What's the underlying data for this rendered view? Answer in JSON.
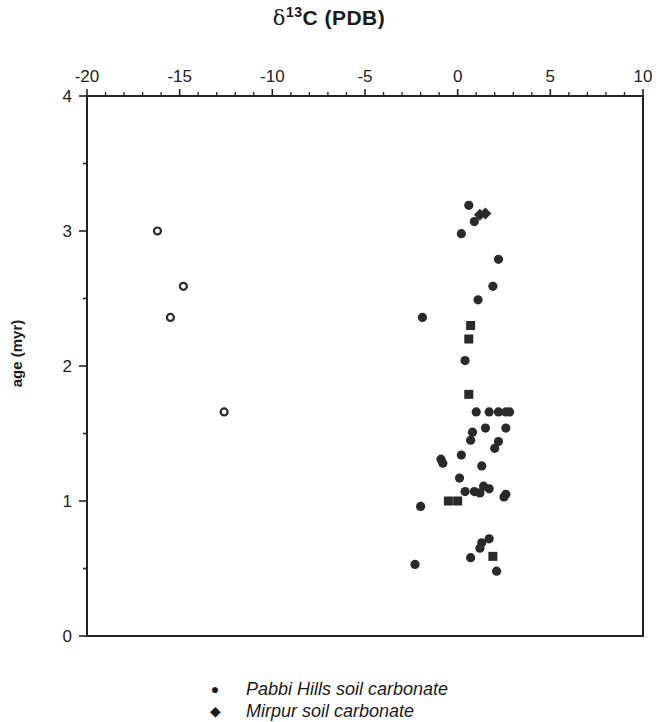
{
  "chart_data": {
    "type": "scatter",
    "title": "δ13C (PDB)",
    "title_parts": {
      "delta": "δ",
      "superscript": "13",
      "main": "C  (PDB)"
    },
    "xlabel": "δ13C (PDB)",
    "ylabel": "age (myr)",
    "x_axis_position": "top",
    "xlim": [
      -20,
      10
    ],
    "ylim": [
      0,
      4
    ],
    "x_ticks": [
      -20,
      -15,
      -10,
      -5,
      0,
      5,
      10
    ],
    "x_tick_labels": [
      "-20",
      "-15",
      "-10",
      "-5",
      "0",
      "5",
      "10"
    ],
    "x_minor_tick_step": 1,
    "y_ticks": [
      0,
      1,
      2,
      3,
      4
    ],
    "y_tick_labels": [
      "0",
      "1",
      "2",
      "3",
      "4"
    ],
    "y_minor_tick_step": 0.5,
    "grid": false,
    "legend_position": "bottom",
    "series": [
      {
        "name": "Pabbi Hills soil carbonate",
        "marker": "filled-circle",
        "points": [
          [
            0.6,
            3.19
          ],
          [
            0.9,
            3.07
          ],
          [
            0.2,
            2.98
          ],
          [
            2.2,
            2.79
          ],
          [
            1.9,
            2.59
          ],
          [
            1.1,
            2.49
          ],
          [
            -1.9,
            2.36
          ],
          [
            0.4,
            2.04
          ],
          [
            1.0,
            1.66
          ],
          [
            1.7,
            1.66
          ],
          [
            2.2,
            1.66
          ],
          [
            2.6,
            1.66
          ],
          [
            2.8,
            1.66
          ],
          [
            1.5,
            1.54
          ],
          [
            0.8,
            1.51
          ],
          [
            0.7,
            1.45
          ],
          [
            2.6,
            1.54
          ],
          [
            2.2,
            1.44
          ],
          [
            2.0,
            1.39
          ],
          [
            -0.9,
            1.31
          ],
          [
            -0.8,
            1.28
          ],
          [
            0.2,
            1.34
          ],
          [
            1.3,
            1.26
          ],
          [
            0.1,
            1.17
          ],
          [
            1.4,
            1.11
          ],
          [
            1.7,
            1.09
          ],
          [
            0.9,
            1.07
          ],
          [
            1.2,
            1.06
          ],
          [
            0.4,
            1.07
          ],
          [
            2.6,
            1.05
          ],
          [
            2.5,
            1.03
          ],
          [
            -2.0,
            0.96
          ],
          [
            1.7,
            0.72
          ],
          [
            1.3,
            0.69
          ],
          [
            1.2,
            0.65
          ],
          [
            0.7,
            0.58
          ],
          [
            2.1,
            0.48
          ],
          [
            -2.3,
            0.53
          ]
        ]
      },
      {
        "name": "Mirpur soil carbonate",
        "marker": "filled-diamond",
        "points": [
          [
            1.5,
            3.13
          ],
          [
            1.2,
            3.12
          ]
        ]
      },
      {
        "name": "filled squares",
        "marker": "filled-square",
        "points": [
          [
            0.7,
            2.3
          ],
          [
            0.6,
            2.2
          ],
          [
            0.6,
            1.79
          ],
          [
            -0.5,
            1.0
          ],
          [
            0.0,
            1.0
          ],
          [
            1.9,
            0.59
          ]
        ]
      },
      {
        "name": "open circles",
        "marker": "open-circle",
        "points": [
          [
            -16.2,
            3.0
          ],
          [
            -14.8,
            2.59
          ],
          [
            -15.5,
            2.36
          ],
          [
            -12.6,
            1.66
          ]
        ]
      }
    ]
  },
  "legend": {
    "items": [
      {
        "symbol": "●",
        "label": "Pabbi Hills soil carbonate"
      },
      {
        "symbol": "◆",
        "label": "Mirpur  soil carbonate"
      }
    ]
  }
}
